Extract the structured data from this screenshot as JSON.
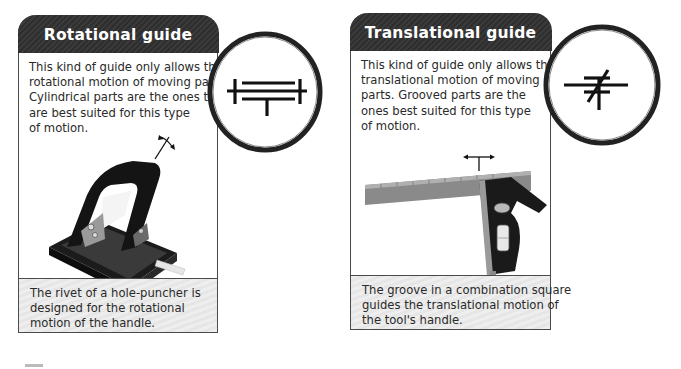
{
  "cards": [
    {
      "title": "Rotational guide",
      "body_lines": [
        "This kind of guide only allows the",
        "rotational motion of moving parts.",
        "Cylindrical parts are the ones that",
        "are best suited for this type",
        "of motion."
      ],
      "illustration": "hole-puncher",
      "symbol": "rotational-guide-symbol",
      "caption_lines": [
        "The rivet of a hole-puncher is",
        "designed for the rotational",
        "motion of the handle."
      ]
    },
    {
      "title": "Translational guide",
      "body_lines": [
        "This kind of guide only allows the",
        "translational motion of moving",
        "parts. Grooved parts are the",
        "ones best suited for this type",
        "of motion."
      ],
      "illustration": "combination-square",
      "symbol": "translational-guide-symbol",
      "caption_lines": [
        "The groove in a combination square",
        "guides the translational motion of",
        "the tool's handle."
      ]
    }
  ],
  "colors": {
    "header_bg": "#333333",
    "border": "#4a4a4a",
    "caption_bg": "#ebebeb",
    "text": "#2a2a2a"
  }
}
